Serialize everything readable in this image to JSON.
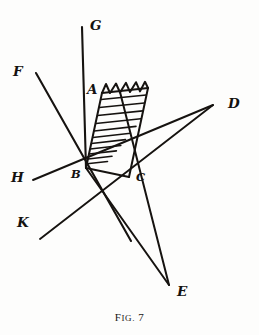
{
  "figure": {
    "caption_prefix": "F",
    "caption_smallcaps": "IG.",
    "caption_number": "7",
    "caption_full": "FIG. 7",
    "ink_color": "#161310",
    "background_color": "#fdfdfc",
    "width": 259,
    "height": 335
  },
  "points": {
    "A": {
      "label": "A",
      "x": 102,
      "y": 93
    },
    "B": {
      "label": "B",
      "x": 86,
      "y": 168
    },
    "C": {
      "label": "C",
      "x": 129,
      "y": 177
    },
    "D": {
      "label": "D",
      "x": 213,
      "y": 105
    },
    "E": {
      "label": "E",
      "x": 169,
      "y": 285
    },
    "F": {
      "label": "F",
      "x": 25,
      "y": 73
    },
    "G": {
      "label": "G",
      "x": 92,
      "y": 30
    },
    "H": {
      "label": "H",
      "x": 22,
      "y": 180
    },
    "K": {
      "label": "K",
      "x": 28,
      "y": 226
    },
    "corner_top_right": {
      "label": "",
      "x": 148,
      "y": 88
    }
  },
  "labels": [
    {
      "name": "label-G",
      "text": "G",
      "left": 90,
      "top": 19,
      "size": "normal"
    },
    {
      "name": "label-F",
      "text": "F",
      "left": 13,
      "top": 65,
      "size": "normal"
    },
    {
      "name": "label-A",
      "text": "A",
      "left": 87,
      "top": 83,
      "size": "normal"
    },
    {
      "name": "label-D",
      "text": "D",
      "left": 228,
      "top": 97,
      "size": "normal"
    },
    {
      "name": "label-H",
      "text": "H",
      "left": 11,
      "top": 171,
      "size": "normal"
    },
    {
      "name": "label-B",
      "text": "B",
      "left": 71,
      "top": 169,
      "size": "small"
    },
    {
      "name": "label-C",
      "text": "C",
      "left": 136,
      "top": 172,
      "size": "small"
    },
    {
      "name": "label-K",
      "text": "K",
      "left": 17,
      "top": 216,
      "size": "normal"
    },
    {
      "name": "label-E",
      "text": "E",
      "left": 177,
      "top": 285,
      "size": "normal"
    }
  ],
  "lines": [
    {
      "name": "line-G-B",
      "from": "G",
      "to": "B",
      "desc": "ray G through A down to B",
      "x1": 82,
      "y1": 27,
      "x2": 86,
      "y2": 168
    },
    {
      "name": "line-F-tail",
      "from": "F",
      "to": "tail",
      "desc": "ray F through B continuing down-right",
      "x1": 36,
      "y1": 73,
      "x2": 131,
      "y2": 241
    },
    {
      "name": "line-H-D",
      "from": "H",
      "to": "D",
      "desc": "ray H through B and C to D",
      "x1": 33,
      "y1": 180,
      "x2": 213,
      "y2": 105
    },
    {
      "name": "line-K-D",
      "from": "K",
      "to": "D",
      "desc": "ray K through C to D",
      "x1": 40,
      "y1": 239,
      "x2": 213,
      "y2": 105
    },
    {
      "name": "line-B-C",
      "from": "B",
      "to": "C",
      "desc": "segment B to C",
      "x1": 86,
      "y1": 168,
      "x2": 129,
      "y2": 177
    },
    {
      "name": "line-B-E",
      "from": "B",
      "to": "E",
      "desc": "segment B to E",
      "x1": 86,
      "y1": 168,
      "x2": 169,
      "y2": 285
    },
    {
      "name": "line-C-E",
      "from": "C",
      "to": "E",
      "desc": "line from top-right corner through C to E",
      "x1": 120,
      "y1": 92,
      "x2": 169,
      "y2": 285
    },
    {
      "name": "line-A-B",
      "from": "A",
      "to": "B",
      "desc": "left edge of hatched region",
      "x1": 102,
      "y1": 93,
      "x2": 86,
      "y2": 168
    },
    {
      "name": "line-corner-C",
      "from": "corner_top_right",
      "to": "C",
      "desc": "right edge of hatched region",
      "x1": 148,
      "y1": 88,
      "x2": 129,
      "y2": 177
    }
  ],
  "region": {
    "name": "hatched-region",
    "vertices": [
      "A",
      "corner_top_right",
      "C",
      "B"
    ],
    "fill_style": "horizontal-hatching",
    "top_edge_style": "sawtooth",
    "hatch_line_count": 11,
    "tooth_count": 6
  }
}
